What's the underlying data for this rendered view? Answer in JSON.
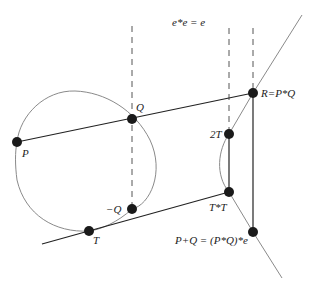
{
  "diagram": {
    "title": "e*e = e",
    "colors": {
      "curve": "#8a8a8a",
      "line": "#222222",
      "point": "#1a1a1a",
      "dashed": "#555555"
    },
    "points": [
      {
        "id": "P",
        "label": "P",
        "x": 17,
        "y": 142
      },
      {
        "id": "Q",
        "label": "Q",
        "x": 132,
        "y": 119
      },
      {
        "id": "R",
        "label": "R=P*Q",
        "x": 253,
        "y": 93
      },
      {
        "id": "2T",
        "label": "2T",
        "x": 229,
        "y": 134
      },
      {
        "id": "TT",
        "label": "T*T",
        "x": 229,
        "y": 192
      },
      {
        "id": "PQ",
        "label": "P+Q = (P*Q)*e",
        "x": 253,
        "y": 232
      },
      {
        "id": "negQ",
        "label": "−Q",
        "x": 132,
        "y": 209
      },
      {
        "id": "T",
        "label": "T",
        "x": 89,
        "y": 231
      }
    ]
  }
}
